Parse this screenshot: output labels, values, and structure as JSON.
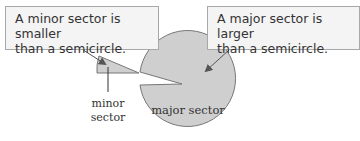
{
  "callouts": {
    "minor": {
      "line1": "A minor sector is smaller",
      "line2": "than a semicircle."
    },
    "major": {
      "line1": "A major sector is larger",
      "line2": "than a semicircle."
    }
  },
  "labels": {
    "minor_line1": "minor",
    "minor_line2": "sector",
    "major": "major sector"
  },
  "colors": {
    "sector_fill": "#cfcfcf",
    "sector_stroke": "#777777",
    "arrow": "#555555"
  }
}
